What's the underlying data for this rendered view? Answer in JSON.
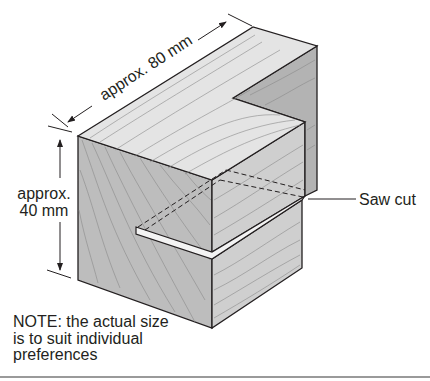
{
  "diagram": {
    "labels": {
      "length": "approx. 80 mm",
      "height_line1": "approx.",
      "height_line2": "40 mm",
      "saw_cut": "Saw cut"
    },
    "note": {
      "line1": "NOTE: the actual size",
      "line2": "is to suit individual",
      "line3": "preferences"
    },
    "colors": {
      "outline": "#231f20",
      "top_face": "#e4e4e4",
      "front_face": "#bdbdbd",
      "side_face": "#cfcfcf",
      "rebate_face": "#b3b3b3",
      "grain": "#8a8a8a",
      "slot": "#f3f3f3"
    }
  }
}
